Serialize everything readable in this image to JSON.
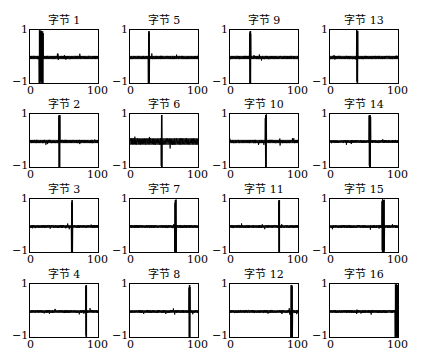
{
  "chart_data": {
    "type": "line",
    "title": "",
    "layout": {
      "rows": 4,
      "cols": 4,
      "grid": false,
      "legend": "none"
    },
    "xlim": [
      0,
      100
    ],
    "ylim": [
      -1,
      1
    ],
    "x_ticks": [
      "0",
      "100"
    ],
    "y_ticks": [
      "1",
      "−1"
    ],
    "subplots": [
      {
        "title": "字节 1",
        "row": 0,
        "col": 0,
        "spike_x": 16,
        "spike_width": 6,
        "noise": 0.06,
        "spike_amplitude": 1.0
      },
      {
        "title": "字节 2",
        "row": 1,
        "col": 0,
        "spike_x": 42,
        "spike_width": 2,
        "noise": 0.06,
        "spike_amplitude": 1.0
      },
      {
        "title": "字节 3",
        "row": 2,
        "col": 0,
        "spike_x": 60,
        "spike_width": 2,
        "noise": 0.05,
        "spike_amplitude": 1.0
      },
      {
        "title": "字节 4",
        "row": 3,
        "col": 0,
        "spike_x": 80,
        "spike_width": 1.5,
        "noise": 0.05,
        "spike_amplitude": 1.0
      },
      {
        "title": "字节 5",
        "row": 0,
        "col": 1,
        "spike_x": 27,
        "spike_width": 2,
        "noise": 0.06,
        "spike_amplitude": 1.0
      },
      {
        "title": "字节 6",
        "row": 1,
        "col": 1,
        "spike_x": 45,
        "spike_width": 1.5,
        "noise": 0.12,
        "spike_amplitude": 1.0
      },
      {
        "title": "字节 7",
        "row": 2,
        "col": 1,
        "spike_x": 65,
        "spike_width": 2.5,
        "noise": 0.05,
        "spike_amplitude": 1.0
      },
      {
        "title": "字节 8",
        "row": 3,
        "col": 1,
        "spike_x": 85,
        "spike_width": 2,
        "noise": 0.05,
        "spike_amplitude": 1.0
      },
      {
        "title": "字节 9",
        "row": 0,
        "col": 2,
        "spike_x": 29,
        "spike_width": 2,
        "noise": 0.06,
        "spike_amplitude": 1.0
      },
      {
        "title": "字节 10",
        "row": 1,
        "col": 2,
        "spike_x": 51,
        "spike_width": 2,
        "noise": 0.06,
        "spike_amplitude": 1.0
      },
      {
        "title": "字节 11",
        "row": 2,
        "col": 2,
        "spike_x": 70,
        "spike_width": 1.5,
        "noise": 0.05,
        "spike_amplitude": 1.0
      },
      {
        "title": "字节 12",
        "row": 3,
        "col": 2,
        "spike_x": 88,
        "spike_width": 2.5,
        "noise": 0.05,
        "spike_amplitude": 1.0
      },
      {
        "title": "字节 13",
        "row": 0,
        "col": 3,
        "spike_x": 39,
        "spike_width": 2,
        "noise": 0.06,
        "spike_amplitude": 1.0
      },
      {
        "title": "字节 14",
        "row": 1,
        "col": 3,
        "spike_x": 57,
        "spike_width": 2.5,
        "noise": 0.05,
        "spike_amplitude": 1.0
      },
      {
        "title": "字节 15",
        "row": 2,
        "col": 3,
        "spike_x": 76,
        "spike_width": 4,
        "noise": 0.05,
        "spike_amplitude": 1.0
      },
      {
        "title": "字节 16",
        "row": 3,
        "col": 3,
        "spike_x": 96,
        "spike_width": 6,
        "noise": 0.05,
        "spike_amplitude": 1.0
      }
    ]
  },
  "style": {
    "line_color": "#000000",
    "axes_color": "#000000",
    "background": "#ffffff",
    "col_left": [
      29,
      129,
      229,
      329
    ],
    "row_top": [
      29,
      113,
      198,
      283
    ],
    "box_width": 70,
    "box_height": 55
  }
}
